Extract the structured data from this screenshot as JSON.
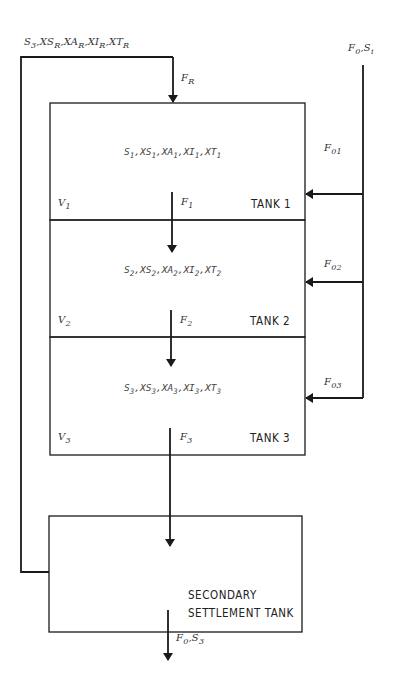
{
  "diagram": {
    "type": "process-flow",
    "tanks": [
      {
        "name": "TANK 1",
        "volume": {
          "base": "V",
          "sub": "1"
        },
        "concentrations": [
          {
            "base": "S",
            "sub": "1"
          },
          {
            "base": "XS",
            "sub": "1"
          },
          {
            "base": "XA",
            "sub": "1"
          },
          {
            "base": "XI",
            "sub": "1"
          },
          {
            "base": "XT",
            "sub": "1"
          }
        ],
        "outflow": {
          "base": "F",
          "sub": "1"
        },
        "feed": {
          "base": "F",
          "sub": "01"
        }
      },
      {
        "name": "TANK 2",
        "volume": {
          "base": "V",
          "sub": "2"
        },
        "concentrations": [
          {
            "base": "S",
            "sub": "2"
          },
          {
            "base": "XS",
            "sub": "2"
          },
          {
            "base": "XA",
            "sub": "2"
          },
          {
            "base": "XI",
            "sub": "2"
          },
          {
            "base": "XT",
            "sub": "2"
          }
        ],
        "outflow": {
          "base": "F",
          "sub": "2"
        },
        "feed": {
          "base": "F",
          "sub": "02"
        }
      },
      {
        "name": "TANK 3",
        "volume": {
          "base": "V",
          "sub": "3"
        },
        "concentrations": [
          {
            "base": "S",
            "sub": "3"
          },
          {
            "base": "XS",
            "sub": "3"
          },
          {
            "base": "XA",
            "sub": "3"
          },
          {
            "base": "XI",
            "sub": "3"
          },
          {
            "base": "XT",
            "sub": "3"
          }
        ],
        "outflow": {
          "base": "F",
          "sub": "3"
        },
        "feed": {
          "base": "F",
          "sub": "03"
        }
      }
    ],
    "recycle": {
      "label_items": [
        {
          "base": "S",
          "sub": "3"
        },
        {
          "base": "XS",
          "sub": "R"
        },
        {
          "base": "XA",
          "sub": "R"
        },
        {
          "base": "XI",
          "sub": "R"
        },
        {
          "base": "XT",
          "sub": "R"
        }
      ],
      "flow": {
        "base": "F",
        "sub": "R"
      }
    },
    "influent": {
      "items": [
        {
          "base": "F",
          "sub": "0"
        },
        {
          "base": "S",
          "sub": "i"
        }
      ]
    },
    "settler": {
      "line1": "SECONDARY",
      "line2": "SETTLEMENT TANK"
    },
    "effluent": {
      "items": [
        {
          "base": "F",
          "sub": "0"
        },
        {
          "base": "S",
          "sub": "3"
        }
      ]
    },
    "colors": {
      "line": "#1a1a1a",
      "text": "#333333",
      "background": "#ffffff"
    }
  }
}
